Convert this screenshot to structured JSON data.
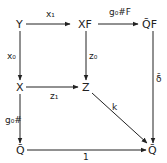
{
  "diagram": {
    "type": "commutative-diagram",
    "nodes": {
      "Y": "Y",
      "XF": "XF",
      "QF": "Q̄F",
      "X": "X",
      "Z": "Z",
      "Q_bottom_left": "Q̄",
      "Q_bottom_right": "Q̄"
    },
    "arrows": {
      "Y_to_XF": "x₁",
      "XF_to_QF": "g₀#F",
      "Y_to_X": "x₀",
      "XF_to_Z": "z₀",
      "X_to_Z": "z₁",
      "Z_to_Q": "k",
      "QF_to_Q": "δ̄",
      "X_to_Q": "g₀#",
      "Q_to_Q": "1"
    },
    "colors": {
      "ink": "#222222",
      "background": "#ffffff"
    }
  }
}
